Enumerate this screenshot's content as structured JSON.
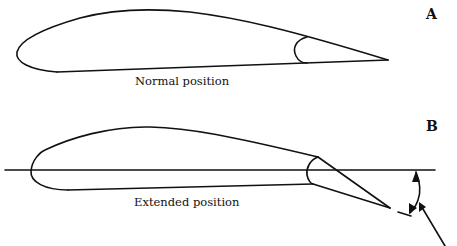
{
  "panels": [
    {
      "tag": "A",
      "caption": "Normal position"
    },
    {
      "tag": "B",
      "caption": "Extended position"
    }
  ],
  "colors": {
    "stroke": "#111111",
    "background": "#ffffff"
  }
}
